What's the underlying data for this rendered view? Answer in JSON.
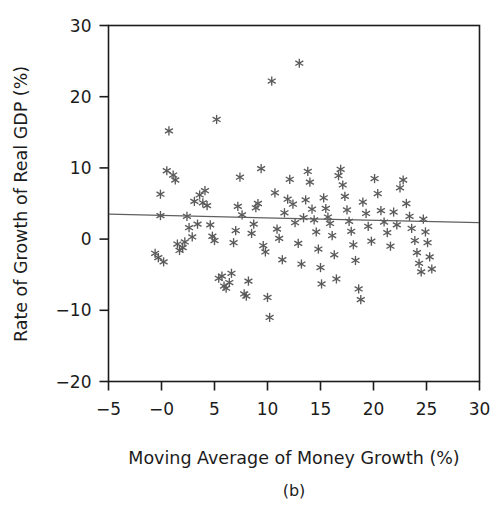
{
  "figure": {
    "caption": "(b)",
    "marker_symbol": "asterisk",
    "marker_color": "#5a5a5a",
    "line_color": "#5f5f5f",
    "axis_color": "#1c1c1c",
    "background": "#ffffff"
  },
  "chart_data": {
    "type": "scatter",
    "title": "",
    "subtitle": "",
    "caption": "(b)",
    "xlabel": "Moving Average of Money Growth (%)",
    "ylabel": "Rate of Growth of Real GDP (%)",
    "xlim": [
      -5,
      30
    ],
    "ylim": [
      -20,
      30
    ],
    "xticks": [
      -5,
      0,
      5,
      10,
      15,
      20,
      25,
      30
    ],
    "xticklabels": [
      "−5",
      "−0",
      "5",
      "10",
      "15",
      "20",
      "25",
      "30"
    ],
    "yticks": [
      -20,
      -10,
      0,
      10,
      20,
      30
    ],
    "yticklabels": [
      "−20",
      "−10",
      "0",
      "10",
      "20",
      "30"
    ],
    "grid": false,
    "legend": null,
    "legend_position": "none",
    "series": [
      {
        "name": "Countries",
        "marker": "asterisk",
        "color": "#5a5a5a",
        "points": [
          [
            -0.6,
            -2.0
          ],
          [
            -0.3,
            -2.6
          ],
          [
            -0.1,
            6.3
          ],
          [
            -0.1,
            3.3
          ],
          [
            0.2,
            -3.2
          ],
          [
            0.5,
            9.6
          ],
          [
            0.7,
            15.2
          ],
          [
            1.1,
            9.0
          ],
          [
            1.3,
            8.3
          ],
          [
            1.5,
            -0.7
          ],
          [
            1.7,
            -1.6
          ],
          [
            2.0,
            -1.2
          ],
          [
            2.2,
            -0.4
          ],
          [
            2.4,
            3.2
          ],
          [
            2.6,
            1.6
          ],
          [
            2.9,
            0.3
          ],
          [
            3.1,
            5.3
          ],
          [
            3.4,
            2.1
          ],
          [
            3.6,
            6.2
          ],
          [
            3.9,
            5.1
          ],
          [
            4.1,
            6.8
          ],
          [
            4.3,
            4.7
          ],
          [
            4.6,
            2.0
          ],
          [
            4.8,
            0.4
          ],
          [
            5.0,
            -0.2
          ],
          [
            5.2,
            16.8
          ],
          [
            5.4,
            -5.5
          ],
          [
            5.7,
            -5.2
          ],
          [
            5.9,
            -6.6
          ],
          [
            6.1,
            -6.9
          ],
          [
            6.4,
            -6.1
          ],
          [
            6.6,
            -4.8
          ],
          [
            6.8,
            -0.5
          ],
          [
            7.0,
            1.2
          ],
          [
            7.2,
            4.6
          ],
          [
            7.4,
            8.7
          ],
          [
            7.6,
            3.4
          ],
          [
            7.8,
            -7.7
          ],
          [
            8.0,
            -8.0
          ],
          [
            8.2,
            -5.9
          ],
          [
            8.5,
            0.8
          ],
          [
            8.7,
            2.1
          ],
          [
            8.9,
            4.4
          ],
          [
            9.1,
            5.0
          ],
          [
            9.4,
            9.9
          ],
          [
            9.6,
            -0.9
          ],
          [
            9.8,
            -1.8
          ],
          [
            10.0,
            -8.2
          ],
          [
            10.2,
            -11.0
          ],
          [
            10.4,
            22.2
          ],
          [
            10.7,
            6.5
          ],
          [
            10.9,
            1.4
          ],
          [
            11.1,
            0.1
          ],
          [
            11.4,
            -2.9
          ],
          [
            11.6,
            3.7
          ],
          [
            11.9,
            5.6
          ],
          [
            12.1,
            8.4
          ],
          [
            12.4,
            4.9
          ],
          [
            12.6,
            2.3
          ],
          [
            12.9,
            -0.6
          ],
          [
            13.0,
            24.7
          ],
          [
            13.2,
            -3.5
          ],
          [
            13.4,
            3.0
          ],
          [
            13.6,
            5.5
          ],
          [
            13.8,
            9.5
          ],
          [
            14.0,
            8.0
          ],
          [
            14.2,
            4.2
          ],
          [
            14.4,
            2.7
          ],
          [
            14.6,
            1.0
          ],
          [
            14.8,
            -1.4
          ],
          [
            15.0,
            -4.0
          ],
          [
            15.1,
            -6.3
          ],
          [
            15.3,
            5.8
          ],
          [
            15.5,
            4.3
          ],
          [
            15.7,
            3.1
          ],
          [
            15.9,
            2.2
          ],
          [
            16.1,
            0.5
          ],
          [
            16.3,
            -2.2
          ],
          [
            16.5,
            -5.6
          ],
          [
            16.7,
            8.9
          ],
          [
            16.9,
            9.8
          ],
          [
            17.1,
            7.6
          ],
          [
            17.3,
            6.0
          ],
          [
            17.5,
            4.1
          ],
          [
            17.7,
            2.5
          ],
          [
            17.9,
            1.1
          ],
          [
            18.1,
            -0.8
          ],
          [
            18.3,
            -3.0
          ],
          [
            18.6,
            -7.0
          ],
          [
            18.8,
            -8.5
          ],
          [
            19.0,
            5.2
          ],
          [
            19.3,
            3.6
          ],
          [
            19.5,
            1.8
          ],
          [
            19.8,
            -0.3
          ],
          [
            20.1,
            8.5
          ],
          [
            20.4,
            6.4
          ],
          [
            20.7,
            4.0
          ],
          [
            21.0,
            2.4
          ],
          [
            21.3,
            0.9
          ],
          [
            21.6,
            -1.0
          ],
          [
            21.9,
            3.8
          ],
          [
            22.2,
            2.0
          ],
          [
            22.5,
            7.2
          ],
          [
            22.8,
            8.3
          ],
          [
            23.1,
            5.0
          ],
          [
            23.4,
            3.2
          ],
          [
            23.6,
            1.5
          ],
          [
            23.9,
            -0.2
          ],
          [
            24.1,
            -1.9
          ],
          [
            24.3,
            -3.4
          ],
          [
            24.5,
            -4.6
          ],
          [
            24.7,
            2.8
          ],
          [
            24.9,
            1.0
          ],
          [
            25.1,
            -0.5
          ],
          [
            25.3,
            -2.5
          ],
          [
            25.5,
            -4.2
          ]
        ]
      }
    ],
    "trendline": {
      "name": "fitted regression line",
      "color": "#5f5f5f",
      "x_start": -5,
      "y_start": 3.5,
      "x_end": 30,
      "y_end": 2.3,
      "slope": -0.034,
      "intercept": 3.33
    }
  }
}
